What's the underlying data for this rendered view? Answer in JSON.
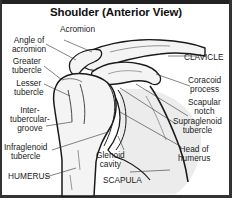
{
  "title": "Shoulder (Anterior View)",
  "labels": {
    "acromion": "Acromion",
    "angle_of_acromion": "Angle of\nacromion",
    "greater_tubercle": "Greater\ntubercle",
    "lesser_tubercle": "Lesser\ntubercle",
    "intertubercular_groove": "Inter-\ntubercular-\ngroove",
    "infraglenoid_tubercle": "Infraglenoid\ntubercle",
    "humerus": "HUMERUS",
    "clavicle": "CLAVICLE",
    "coracoid_process": "Coracoid\nprocess",
    "scapular_notch": "Scapular\nnotch",
    "supraglenoid_tubercle": "Supraglenoid\ntubercle",
    "head_of_humerus": "Head of\nhumerus",
    "glenoid_cavity": "Glenoid\ncavity",
    "scapula": "SCAPULA"
  },
  "colors": {
    "border": "#222222",
    "bone_outline": "#1a1a1a",
    "bone_fill": "#f2f2f2",
    "shade": "#d9d9d9",
    "text": "#1a1a1a"
  }
}
